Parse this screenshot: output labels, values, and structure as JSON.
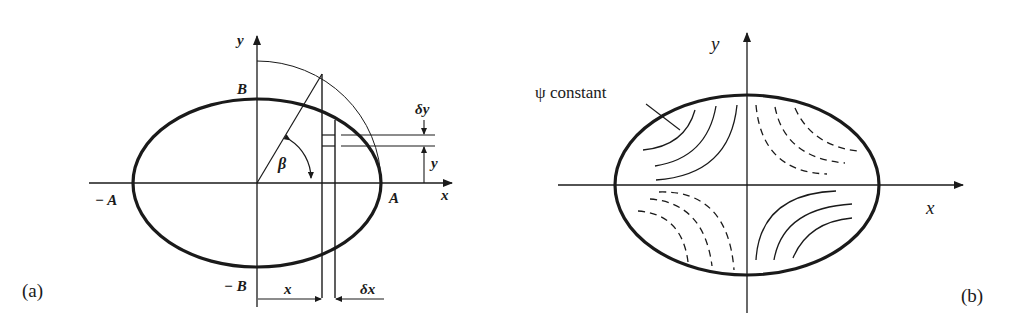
{
  "figure": {
    "panels": [
      {
        "id": "a",
        "caption": "(a)",
        "axis_labels": {
          "x": "x",
          "y": "y"
        },
        "point_labels": {
          "pos_major": "A",
          "neg_major": "− A",
          "pos_minor": "B",
          "neg_minor": "− B"
        },
        "angle_label": "β",
        "dimension_labels": {
          "x_distance": "x",
          "delta_x": "δx",
          "y_distance": "y",
          "delta_y": "δy"
        },
        "description": "Ellipse with semi-axes A and B, auxiliary circle, angle beta, and elemental strip of width delta x"
      },
      {
        "id": "b",
        "caption": "(b)",
        "axis_labels": {
          "x": "x",
          "y": "y"
        },
        "annotation": "ψ constant",
        "description": "Ellipse with contours of constant psi: solid curves in 2nd and 4th quadrants, dashed curves in 1st and 3rd quadrants"
      }
    ],
    "colors": {
      "ink": "#1a1a1a",
      "background": "#ffffff"
    }
  }
}
